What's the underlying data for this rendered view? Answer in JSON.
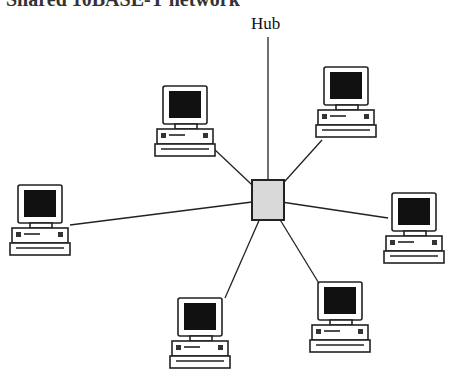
{
  "title": "Shared 10BASE-T network",
  "hub": {
    "label": "Hub",
    "x": 252,
    "y": 180,
    "w": 32,
    "h": 40,
    "fill": "#d9d9d9"
  },
  "computers": [
    {
      "name": "computer-top-left",
      "x": 155,
      "y": 86,
      "link": [
        213,
        148
      ]
    },
    {
      "name": "computer-top-right",
      "x": 316,
      "y": 67,
      "link": [
        322,
        140
      ]
    },
    {
      "name": "computer-left",
      "x": 10,
      "y": 185,
      "link": [
        70,
        225
      ]
    },
    {
      "name": "computer-right",
      "x": 384,
      "y": 193,
      "link": [
        388,
        218
      ]
    },
    {
      "name": "computer-bottom-left",
      "x": 170,
      "y": 298,
      "link": [
        225,
        298
      ]
    },
    {
      "name": "computer-bottom-right",
      "x": 310,
      "y": 282,
      "link": [
        320,
        285
      ]
    }
  ],
  "colors": {
    "line": "#222222",
    "screen": "#111111",
    "body": "#ffffff"
  }
}
